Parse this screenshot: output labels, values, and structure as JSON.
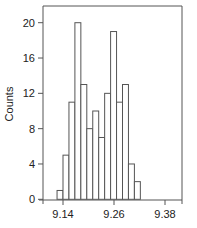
{
  "chart_data": {
    "type": "bar",
    "subtype": "histogram",
    "title": "",
    "xlabel": "",
    "ylabel": "Counts",
    "bin_start": 9.126,
    "bin_width": 0.014,
    "categories": [
      "9.126",
      "9.140",
      "9.154",
      "9.168",
      "9.182",
      "9.196",
      "9.210",
      "9.224",
      "9.238",
      "9.252",
      "9.266",
      "9.280",
      "9.294",
      "9.308"
    ],
    "values": [
      1,
      5,
      11,
      20,
      13,
      8,
      10,
      7,
      12,
      19,
      11,
      13,
      4,
      2
    ],
    "xlim": [
      9.09,
      9.41
    ],
    "ylim": [
      0,
      22
    ],
    "xticks": [
      9.14,
      9.26,
      9.38
    ],
    "xtick_labels": [
      "9.14",
      "9.26",
      "9.38"
    ],
    "yticks": [
      0,
      4,
      8,
      12,
      16,
      20
    ],
    "ytick_labels": [
      "0",
      "4",
      "8",
      "12",
      "16",
      "20"
    ],
    "grid": false,
    "legend": null,
    "bar_fill": "#ffffff",
    "bar_edge": "#555555",
    "frame": "top-right box"
  }
}
